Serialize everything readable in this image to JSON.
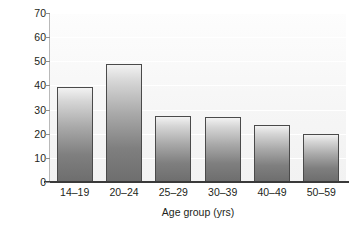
{
  "chart_data": {
    "type": "bar",
    "title": "",
    "subtitle": "",
    "categories": [
      "14–19",
      "20–24",
      "25–29",
      "30–39",
      "40–49",
      "50–59"
    ],
    "values": [
      39.5,
      49,
      27.5,
      27,
      23.5,
      20
    ],
    "xlabel": "Age group (yrs)",
    "ylabel": "Percentage",
    "ylim": [
      0,
      70
    ],
    "ytick_values": [
      0,
      10,
      20,
      30,
      40,
      50,
      60,
      70
    ],
    "ytick_labels": [
      "0",
      "10",
      "20",
      "30",
      "40",
      "50",
      "60",
      "70"
    ],
    "grid": true,
    "grid_axis": "y",
    "legend": false,
    "legend_position": "none",
    "annotations": [],
    "colors": {
      "bar_top": "#f2f2f2",
      "bar_bottom": "#6e6e6e",
      "bar_edge": "#4a4a4a",
      "plot_background": "#f6f6f6",
      "gridline": "#ffffff",
      "axis_line": "#3a3a3a",
      "text": "#231f20",
      "page_background": "#ffffff"
    }
  },
  "axes": {
    "y_title": "Percentage",
    "x_title": "Age group (yrs)",
    "y_ticks": [
      {
        "label": "70",
        "value": 70
      },
      {
        "label": "60",
        "value": 60
      },
      {
        "label": "50",
        "value": 50
      },
      {
        "label": "40",
        "value": 40
      },
      {
        "label": "30",
        "value": 30
      },
      {
        "label": "20",
        "value": 20
      },
      {
        "label": "10",
        "value": 10
      },
      {
        "label": "0",
        "value": 0
      }
    ],
    "x_ticks": [
      {
        "label": "14–19"
      },
      {
        "label": "20–24"
      },
      {
        "label": "25–29"
      },
      {
        "label": "30–39"
      },
      {
        "label": "40–49"
      },
      {
        "label": "50–59"
      }
    ]
  }
}
